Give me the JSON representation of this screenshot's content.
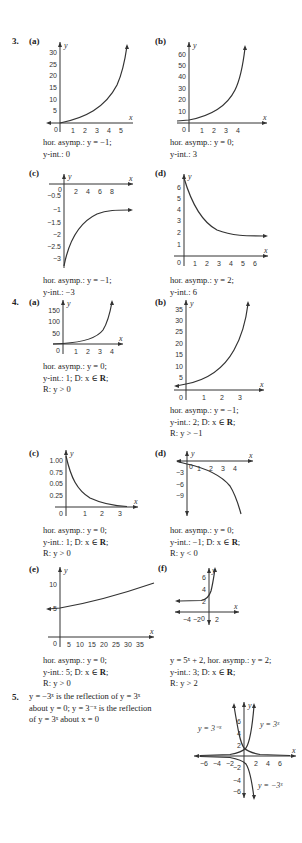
{
  "questions": [
    {
      "number": "3.",
      "parts": [
        {
          "label": "(a)",
          "lines": [
            "hor. asymp.: y = −1;",
            "y-int.: 0"
          ],
          "graph": {
            "x_ticks": [
              "1",
              "2",
              "3",
              "4",
              "5"
            ],
            "y_ticks": [
              "5",
              "10",
              "15",
              "20",
              "25",
              "30"
            ],
            "origin": "0",
            "xlabel": "x",
            "ylabel": "y"
          }
        },
        {
          "label": "(b)",
          "lines": [
            "hor. asymp.: y = 0;",
            "y-int.: 3"
          ],
          "graph": {
            "x_ticks": [
              "1",
              "2",
              "3",
              "4"
            ],
            "y_ticks": [
              "10",
              "20",
              "30",
              "40",
              "50",
              "60"
            ],
            "origin": "0",
            "xlabel": "x",
            "ylabel": "y"
          }
        },
        {
          "label": "(c)",
          "lines": [
            "hor. asymp.: y = −1;",
            "y-int.: −3"
          ],
          "graph": {
            "x_ticks": [
              "2",
              "4",
              "6",
              "8"
            ],
            "y_ticks": [
              "−0.5",
              "−1",
              "−1.5",
              "−2",
              "−2.5",
              "−3"
            ],
            "origin": "0",
            "xlabel": "x",
            "ylabel": "y"
          }
        },
        {
          "label": "(d)",
          "lines": [
            "hor. asymp.: y = 2;",
            "y-int.: 6"
          ],
          "graph": {
            "x_ticks": [
              "1",
              "2",
              "3",
              "4",
              "5",
              "6"
            ],
            "y_ticks": [
              "1",
              "2",
              "3",
              "4",
              "5",
              "6"
            ],
            "origin": "0",
            "xlabel": "x",
            "ylabel": "y"
          }
        }
      ]
    },
    {
      "number": "4.",
      "parts": [
        {
          "label": "(a)",
          "lines": [
            "hor. asymp.: y = 0;",
            "y-int.: 1; D: x ∈ ",
            "R: y > 0"
          ],
          "bold_R_line": 1,
          "graph": {
            "x_ticks": [
              "1",
              "2",
              "3",
              "4"
            ],
            "y_ticks": [
              "50",
              "100",
              "150"
            ],
            "origin": "0",
            "xlabel": "x",
            "ylabel": "y"
          }
        },
        {
          "label": "(b)",
          "lines": [
            "hor. asymp.: y = −1;",
            "y-int.: 2; D: x ∈ ",
            "R: y > −1"
          ],
          "bold_R_line": 1,
          "graph": {
            "x_ticks": [
              "1",
              "2",
              "3"
            ],
            "y_ticks": [
              "5",
              "10",
              "15",
              "20",
              "25",
              "30",
              "35"
            ],
            "origin": "0",
            "xlabel": "x",
            "ylabel": "y"
          }
        },
        {
          "label": "(c)",
          "lines": [
            "hor. asymp.: y = 0;",
            "y-int.: 1; D: x ∈ ",
            "R: y > 0"
          ],
          "bold_R_line": 1,
          "graph": {
            "x_ticks": [
              "1",
              "2",
              "3"
            ],
            "y_ticks": [
              "1.00",
              "0.75",
              "0.05",
              "0.25"
            ],
            "origin": "0",
            "xlabel": "x",
            "ylabel": "y"
          }
        },
        {
          "label": "(d)",
          "lines": [
            "hor. asymp.: y = 0;",
            "y-int.: −1; D: x ∈ ",
            "R: y < 0"
          ],
          "bold_R_line": 1,
          "graph": {
            "x_ticks": [
              "1",
              "2",
              "3",
              "4"
            ],
            "y_ticks": [
              "−3",
              "−6",
              "−9"
            ],
            "origin": "0",
            "xlabel": "x",
            "ylabel": "y"
          }
        },
        {
          "label": "(e)",
          "lines": [
            "hor. asymp.: y = 0;",
            "y-int.: 5; D: x ∈ ",
            "R: y > 0"
          ],
          "bold_R_line": 1,
          "graph": {
            "x_ticks": [
              "5",
              "10",
              "15",
              "20",
              "25",
              "30",
              "35"
            ],
            "y_ticks": [
              "5",
              "10"
            ],
            "origin": "0",
            "xlabel": "x",
            "ylabel": "y"
          }
        },
        {
          "label": "(f)",
          "lines": [
            "y = 5ˣ + 2, hor. asymp.: y = 2;",
            "y-int.: 3; D: x ∈ ",
            "R: y > 2"
          ],
          "bold_R_line": 1,
          "graph": {
            "x_ticks": [
              "−4",
              "−2",
              "2"
            ],
            "y_ticks": [
              "2",
              "4",
              "6"
            ],
            "origin": "0",
            "xlabel": "x",
            "ylabel": "y"
          }
        }
      ]
    },
    {
      "number": "5.",
      "text_lines": [
        "y = −3ˣ is the reflection of y = 3ˣ",
        "about y = 0; y = 3⁻ˣ is the reflection",
        "of y = 3ˣ about x = 0"
      ],
      "graph": {
        "x_ticks": [
          "−6",
          "−4",
          "−2",
          "2",
          "4",
          "6"
        ],
        "y_ticks": [
          "6",
          "4",
          "2",
          "−2",
          "−4",
          "−6"
        ],
        "xlabel": "x",
        "ylabel": "y",
        "curve_labels": [
          "y = 3⁻ˣ",
          "y = 3ˣ",
          "y = −3ˣ"
        ]
      }
    }
  ],
  "bold_R": "R",
  "bold_R_suffix": ";"
}
